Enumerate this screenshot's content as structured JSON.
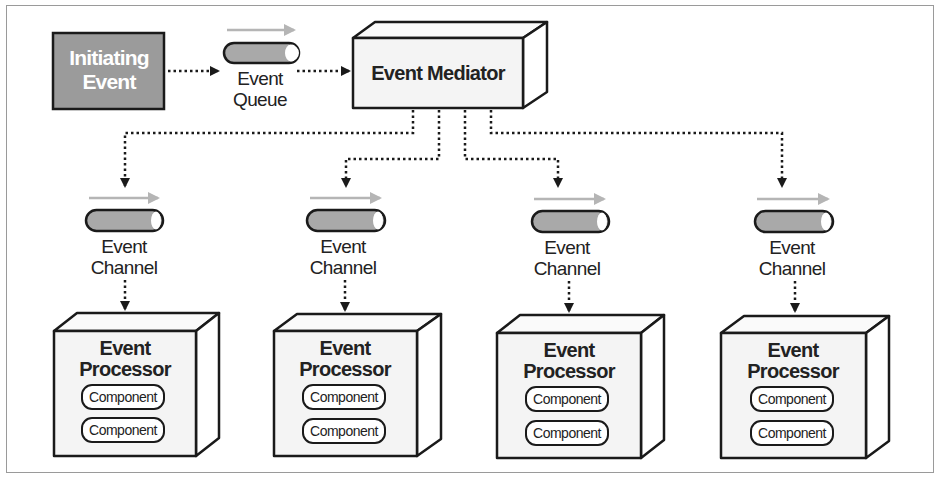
{
  "diagram": {
    "initiating_event": {
      "line1": "Initiating",
      "line2": "Event"
    },
    "event_queue": {
      "line1": "Event",
      "line2": "Queue"
    },
    "event_mediator": {
      "label": "Event Mediator"
    },
    "channels": [
      {
        "line1": "Event",
        "line2": "Channel"
      },
      {
        "line1": "Event",
        "line2": "Channel"
      },
      {
        "line1": "Event",
        "line2": "Channel"
      },
      {
        "line1": "Event",
        "line2": "Channel"
      }
    ],
    "processors": [
      {
        "line1": "Event",
        "line2": "Processor",
        "components": [
          "Component",
          "Component"
        ]
      },
      {
        "line1": "Event",
        "line2": "Processor",
        "components": [
          "Component",
          "Component"
        ]
      },
      {
        "line1": "Event",
        "line2": "Processor",
        "components": [
          "Component",
          "Component"
        ]
      },
      {
        "line1": "Event",
        "line2": "Processor",
        "components": [
          "Component",
          "Component"
        ]
      }
    ],
    "colors": {
      "initiating_fill": "#9b9b9b",
      "box_fill": "#f4f4f4",
      "tube_fill": "#a9a9a9",
      "flow_arrow": "#b5b5b5",
      "stroke": "#1a1a1a",
      "frame": "#9a9a9a"
    }
  }
}
